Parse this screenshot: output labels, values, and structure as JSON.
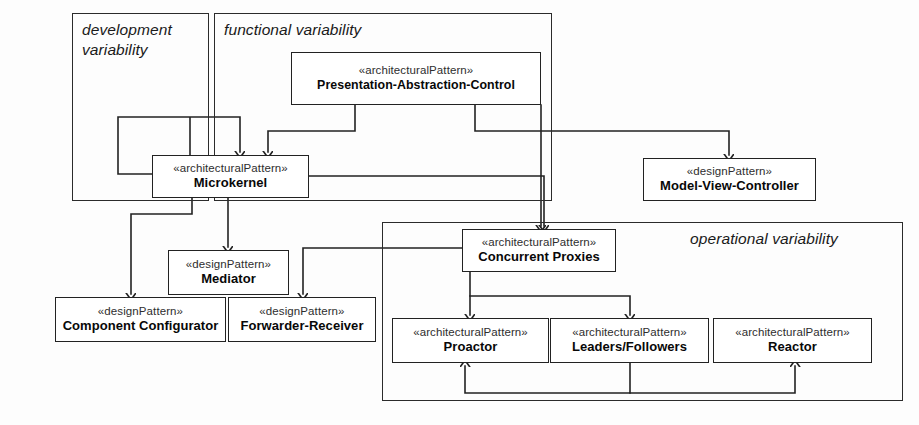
{
  "diagram": {
    "line_color": "#222222",
    "text_color": "#0a0a0a"
  },
  "groups": [
    {
      "id": "development",
      "label": "development\nvariability",
      "x": 72,
      "y": 13,
      "w": 137,
      "h": 188,
      "label_x": 82,
      "label_y": 20
    },
    {
      "id": "functional",
      "label": "functional variability",
      "x": 214,
      "y": 13,
      "w": 338,
      "h": 188,
      "label_x": 224,
      "label_y": 20
    },
    {
      "id": "operational",
      "label": "operational variability",
      "x": 382,
      "y": 222,
      "w": 521,
      "h": 179,
      "label_x": 690,
      "label_y": 229
    }
  ],
  "nodes": [
    {
      "id": "pac",
      "stereotype": "«architecturalPattern»",
      "name": "Presentation-Abstraction-Control",
      "x": 291,
      "y": 52,
      "w": 250,
      "h": 53
    },
    {
      "id": "microkernel",
      "stereotype": "«architecturalPattern»",
      "name": "Microkernel",
      "x": 152,
      "y": 155,
      "w": 157,
      "h": 43
    },
    {
      "id": "mvc",
      "stereotype": "«designPattern»",
      "name": "Model-View-Controller",
      "x": 643,
      "y": 158,
      "w": 173,
      "h": 43
    },
    {
      "id": "mediator",
      "stereotype": "«designPattern»",
      "name": "Mediator",
      "x": 168,
      "y": 250,
      "w": 121,
      "h": 45
    },
    {
      "id": "component-configurator",
      "stereotype": "«designPattern»",
      "name": "Component Configurator",
      "x": 55,
      "y": 297,
      "w": 171,
      "h": 45
    },
    {
      "id": "forwarder-receiver",
      "stereotype": "«designPattern»",
      "name": "Forwarder-Receiver",
      "x": 228,
      "y": 297,
      "w": 148,
      "h": 45
    },
    {
      "id": "concurrent-proxies",
      "stereotype": "«architecturalPattern»",
      "name": "Concurrent Proxies",
      "x": 462,
      "y": 229,
      "w": 154,
      "h": 43
    },
    {
      "id": "proactor",
      "stereotype": "«architecturalPattern»",
      "name": "Proactor",
      "x": 392,
      "y": 318,
      "w": 157,
      "h": 45
    },
    {
      "id": "leaders-followers",
      "stereotype": "«architecturalPattern»",
      "name": "Leaders/Followers",
      "x": 550,
      "y": 318,
      "w": 159,
      "h": 45
    },
    {
      "id": "reactor",
      "stereotype": "«architecturalPattern»",
      "name": "Reactor",
      "x": 713,
      "y": 318,
      "w": 159,
      "h": 45
    }
  ],
  "edges": [
    {
      "id": "pac-to-microkernel",
      "from": "pac",
      "to": "microkernel",
      "path": "M 355 105 L 355 131 L 268 131 L 268 152"
    },
    {
      "id": "pac-to-mvc",
      "from": "pac",
      "to": "mvc",
      "path": "M 475 105 L 475 131 L 729 131 L 729 155"
    },
    {
      "id": "pac-to-concurrent-proxies",
      "from": "pac",
      "to": "concurrent-proxies",
      "path": "M 541 105 L 541 226"
    },
    {
      "id": "microkernel-self-loop",
      "from": "microkernel",
      "to": "microkernel",
      "path": "M 190 155 L 190 117 L 118 117 L 118 174 L 152 174 M 190 155 L 190 117 L 240 117 L 240 152"
    },
    {
      "id": "microkernel-to-concurrent-proxies",
      "from": "microkernel",
      "to": "concurrent-proxies",
      "path": "M 309 176 L 544 176 L 544 226"
    },
    {
      "id": "microkernel-to-component-configurator",
      "from": "microkernel",
      "to": "component-configurator",
      "path": "M 192 198 L 192 214 L 131 214 L 131 294"
    },
    {
      "id": "microkernel-to-mediator",
      "from": "microkernel",
      "to": "mediator",
      "path": "M 228 198 L 228 247"
    },
    {
      "id": "concurrent-proxies-to-forwarder-receiver",
      "from": "concurrent-proxies",
      "to": "forwarder-receiver",
      "path": "M 462 248 L 303 248 L 303 294"
    },
    {
      "id": "concurrent-proxies-to-proactor",
      "from": "concurrent-proxies",
      "to": "proactor",
      "path": "M 470 272 L 470 296 L 470 315"
    },
    {
      "id": "concurrent-proxies-to-leaders-followers",
      "from": "concurrent-proxies",
      "to": "leaders-followers",
      "path": "M 470 296 L 630 296 L 630 315"
    },
    {
      "id": "leaders-followers-to-proactor",
      "from": "leaders-followers",
      "to": "proactor",
      "path": "M 630 363 L 630 393 L 465 393 L 465 366"
    },
    {
      "id": "leaders-followers-to-reactor",
      "from": "leaders-followers",
      "to": "reactor",
      "path": "M 630 393 L 795 393 L 795 366"
    }
  ]
}
